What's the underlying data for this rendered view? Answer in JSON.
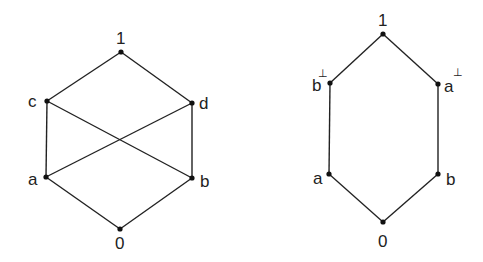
{
  "diagrams": [
    {
      "name": "lattice-with-crossing",
      "nodes": [
        {
          "id": "1",
          "label": "1",
          "x": 121,
          "y": 52
        },
        {
          "id": "c",
          "label": "c",
          "x": 47,
          "y": 101
        },
        {
          "id": "d",
          "label": "d",
          "x": 192,
          "y": 103
        },
        {
          "id": "a",
          "label": "a",
          "x": 46,
          "y": 177
        },
        {
          "id": "b",
          "label": "b",
          "x": 192,
          "y": 178
        },
        {
          "id": "0",
          "label": "0",
          "x": 120,
          "y": 229
        }
      ],
      "edges": [
        [
          "1",
          "c"
        ],
        [
          "1",
          "d"
        ],
        [
          "c",
          "a"
        ],
        [
          "d",
          "b"
        ],
        [
          "c",
          "b"
        ],
        [
          "d",
          "a"
        ],
        [
          "a",
          "0"
        ],
        [
          "b",
          "0"
        ]
      ]
    },
    {
      "name": "hexagon-orthocomplemented",
      "nodes": [
        {
          "id": "1",
          "label": "1",
          "x": 383,
          "y": 34
        },
        {
          "id": "bp",
          "label": "b",
          "sup": "⊥",
          "x": 330,
          "y": 83
        },
        {
          "id": "ap",
          "label": "a",
          "sup": "⊥",
          "x": 438,
          "y": 84
        },
        {
          "id": "a",
          "label": "a",
          "x": 329,
          "y": 174
        },
        {
          "id": "b",
          "label": "b",
          "x": 438,
          "y": 174
        },
        {
          "id": "0",
          "label": "0",
          "x": 383,
          "y": 222
        }
      ],
      "edges": [
        [
          "1",
          "bp"
        ],
        [
          "1",
          "ap"
        ],
        [
          "bp",
          "a"
        ],
        [
          "ap",
          "b"
        ],
        [
          "a",
          "0"
        ],
        [
          "b",
          "0"
        ]
      ]
    }
  ],
  "labels": {
    "left": {
      "one": "1",
      "c": "c",
      "d": "d",
      "a": "a",
      "b": "b",
      "zero": "0"
    },
    "right": {
      "one": "1",
      "b_perp": "b",
      "a_perp": "a",
      "perp": "⊥",
      "a": "a",
      "b": "b",
      "zero": "0"
    }
  }
}
